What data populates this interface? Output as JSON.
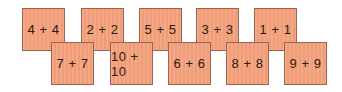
{
  "colors": {
    "card_fill": "#f4a37f",
    "card_border": "#9a6450",
    "text": "#2a1a10"
  },
  "top_row": [
    {
      "label": "4 + 4"
    },
    {
      "label": "2 + 2"
    },
    {
      "label": "5 + 5"
    },
    {
      "label": "3 + 3"
    },
    {
      "label": "1 + 1"
    }
  ],
  "bottom_row": [
    {
      "label": "7 + 7"
    },
    {
      "label": "10 + 10"
    },
    {
      "label": "6 + 6"
    },
    {
      "label": "8 + 8"
    },
    {
      "label": "9 + 9"
    }
  ]
}
